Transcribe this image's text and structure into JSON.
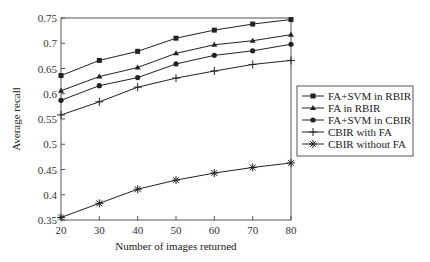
{
  "chart_data": {
    "type": "line",
    "title": "",
    "xlabel": "Number of images returned",
    "ylabel": "Average recall",
    "x": [
      20,
      30,
      40,
      50,
      60,
      70,
      80
    ],
    "xlim": [
      20,
      80
    ],
    "ylim": [
      0.35,
      0.75
    ],
    "x_ticks": [
      "20",
      "30",
      "40",
      "50",
      "60",
      "70",
      "80"
    ],
    "y_ticks": [
      "0.35",
      "0.4",
      "0.45",
      "0.5",
      "0.55",
      "0.6",
      "0.65",
      "0.7",
      "0.75"
    ],
    "grid": false,
    "legend_position": "right",
    "series": [
      {
        "name": "FA+SVM in RBIR",
        "marker": "square",
        "values": [
          0.636,
          0.666,
          0.684,
          0.71,
          0.726,
          0.738,
          0.747
        ]
      },
      {
        "name": "FA in RBIR",
        "marker": "triangle",
        "values": [
          0.606,
          0.634,
          0.652,
          0.68,
          0.697,
          0.705,
          0.717
        ]
      },
      {
        "name": "FA+SVM in CBIR",
        "marker": "circle",
        "values": [
          0.587,
          0.616,
          0.632,
          0.659,
          0.676,
          0.685,
          0.698
        ]
      },
      {
        "name": "CBIR with FA",
        "marker": "plus",
        "values": [
          0.558,
          0.584,
          0.613,
          0.631,
          0.645,
          0.658,
          0.666
        ]
      },
      {
        "name": "CBIR without FA",
        "marker": "star",
        "values": [
          0.355,
          0.383,
          0.411,
          0.429,
          0.443,
          0.454,
          0.463
        ]
      }
    ]
  },
  "colors": {
    "line": "#222222",
    "axis": "#555555",
    "legend_border": "#555555"
  }
}
